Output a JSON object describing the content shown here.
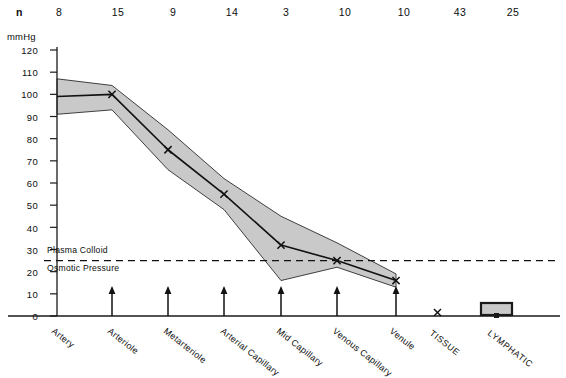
{
  "chart_data": {
    "type": "line",
    "title": "",
    "xlabel": "",
    "ylabel": "mmHg",
    "ylim": [
      0,
      120
    ],
    "ytick_step": 10,
    "grid": false,
    "legend": "none",
    "categories": [
      "Artery",
      "Arteriole",
      "Metarteriole",
      "Arterial Capillary",
      "Mid Capillary",
      "Venous Capillary",
      "Venule",
      "TISSUE",
      "LYMPHATIC"
    ],
    "yticks": [
      0,
      10,
      20,
      30,
      40,
      50,
      60,
      70,
      80,
      90,
      100,
      110,
      120
    ],
    "n_row_label": "n",
    "n_values": [
      8,
      15,
      9,
      14,
      3,
      10,
      10,
      43,
      25
    ],
    "series": [
      {
        "name": "Mean pressure",
        "values": [
          100,
          75,
          55,
          32,
          25,
          16,
          14,
          null,
          null
        ]
      },
      {
        "name": "Upper range",
        "values": [
          104,
          84,
          62,
          45,
          33,
          19,
          16,
          null,
          null
        ]
      },
      {
        "name": "Lower range",
        "values": [
          93,
          66,
          48,
          16,
          22,
          13,
          12,
          null,
          null
        ]
      }
    ],
    "band_origin": {
      "mean": 99,
      "upper": 107,
      "lower": 91
    },
    "annotations": [
      {
        "name": "plasma-colloid-osmotic-pressure",
        "value": 25,
        "line_1": "Plasma Colloid",
        "line_2": "Osmotic Pressure",
        "style": "dashed"
      }
    ],
    "marker": "x",
    "band_fill": "#c9c9c9",
    "line_color": "#111111",
    "axis_color": "#1a1a1a"
  },
  "axis": {
    "unit": "mmHg"
  }
}
